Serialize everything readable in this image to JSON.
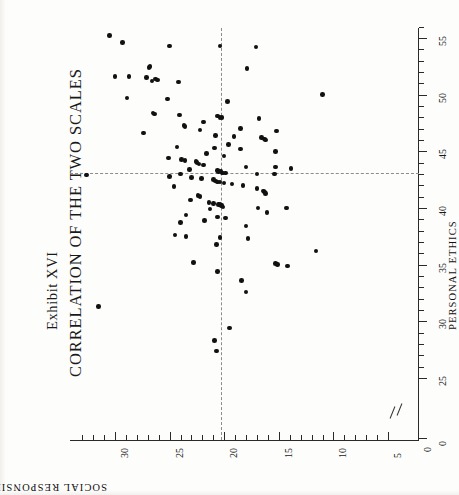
{
  "exhibit_label": "Exhibit XVI",
  "title": "CORRELATION OF THE TWO SCALES",
  "axes": {
    "horizontal_axis_title": "SOCIAL RESPONSIBILITY",
    "vertical_axis_title": "PERSONAL ETHICS"
  },
  "chart_data": {
    "type": "scatter",
    "title": "CORRELATION OF THE TWO SCALES",
    "subtitle": "Exhibit XVI",
    "orientation": "page rotated 90 degrees counter-clockwise",
    "xlabel": "PERSONAL ETHICS",
    "ylabel": "SOCIAL RESPONSIBILITY",
    "xlim": [
      25,
      56
    ],
    "ylim": [
      5,
      33
    ],
    "x_ticks": [
      0,
      25,
      30,
      35,
      40,
      45,
      50,
      55
    ],
    "x_tick_labels": [
      "0",
      "25",
      "30",
      "35",
      "40",
      "45",
      "50",
      "55"
    ],
    "x_minor_tick_step": 1,
    "y_ticks": [
      5,
      10,
      15,
      20,
      25,
      30
    ],
    "y_tick_labels": [
      "5",
      "10",
      "15",
      "20",
      "25",
      "30"
    ],
    "y_minor_tick_step": 1,
    "y_axis_origin_label": "0",
    "grid": false,
    "legend": null,
    "axis_break_horizontal": true,
    "axis_break_vertical": true,
    "reference_lines": [
      {
        "name": "mean-personal-ethics",
        "axis": "PERSONAL ETHICS",
        "value": 43.1,
        "style": "dashed"
      },
      {
        "name": "mean-social-responsibility",
        "axis": "SOCIAL RESPONSIBILITY",
        "value": 20.3,
        "style": "dashed"
      }
    ],
    "point_count": 118,
    "points": [
      [
        55.2,
        30.5
      ],
      [
        54.6,
        29.3
      ],
      [
        54.3,
        25.0
      ],
      [
        54.3,
        20.4
      ],
      [
        54.2,
        17.1
      ],
      [
        52.5,
        26.8
      ],
      [
        52.4,
        26.9
      ],
      [
        52.3,
        17.9
      ],
      [
        51.6,
        30.0
      ],
      [
        51.6,
        28.7
      ],
      [
        51.5,
        27.1
      ],
      [
        51.4,
        26.3
      ],
      [
        51.3,
        26.1
      ],
      [
        51.2,
        26.6
      ],
      [
        51.1,
        24.2
      ],
      [
        50.0,
        11.0
      ],
      [
        49.7,
        28.9
      ],
      [
        49.6,
        25.2
      ],
      [
        48.4,
        26.5
      ],
      [
        48.3,
        26.4
      ],
      [
        48.2,
        24.1
      ],
      [
        48.1,
        20.6
      ],
      [
        48.0,
        20.4
      ],
      [
        48.0,
        20.2
      ],
      [
        47.9,
        16.8
      ],
      [
        47.3,
        23.7
      ],
      [
        47.2,
        23.6
      ],
      [
        47.0,
        18.5
      ],
      [
        46.8,
        15.2
      ],
      [
        46.6,
        27.4
      ],
      [
        46.4,
        20.8
      ],
      [
        46.3,
        19.1
      ],
      [
        46.2,
        16.6
      ],
      [
        46.1,
        16.3
      ],
      [
        46.0,
        16.2
      ],
      [
        45.4,
        24.3
      ],
      [
        45.3,
        20.9
      ],
      [
        45.2,
        18.5
      ],
      [
        45.0,
        15.3
      ],
      [
        44.4,
        25.1
      ],
      [
        44.3,
        23.9
      ],
      [
        44.2,
        23.6
      ],
      [
        44.1,
        22.6
      ],
      [
        44.0,
        22.5
      ],
      [
        43.9,
        22.3
      ],
      [
        43.8,
        21.9
      ],
      [
        43.6,
        18.0
      ],
      [
        43.6,
        15.3
      ],
      [
        43.4,
        23.2
      ],
      [
        43.3,
        20.6
      ],
      [
        43.2,
        20.5
      ],
      [
        43.2,
        20.3
      ],
      [
        43.1,
        20.2
      ],
      [
        43.1,
        20.1
      ],
      [
        43.1,
        19.9
      ],
      [
        43.0,
        24.0
      ],
      [
        43.0,
        17.0
      ],
      [
        43.0,
        15.4
      ],
      [
        42.9,
        32.6
      ],
      [
        42.8,
        25.0
      ],
      [
        42.6,
        22.1
      ],
      [
        42.5,
        21.0
      ],
      [
        42.4,
        20.8
      ],
      [
        42.3,
        20.6
      ],
      [
        42.3,
        20.4
      ],
      [
        42.2,
        20.0
      ],
      [
        42.1,
        19.3
      ],
      [
        42.0,
        18.3
      ],
      [
        41.9,
        24.6
      ],
      [
        41.7,
        17.0
      ],
      [
        41.5,
        16.4
      ],
      [
        41.4,
        16.3
      ],
      [
        41.3,
        16.2
      ],
      [
        40.7,
        23.1
      ],
      [
        40.5,
        21.4
      ],
      [
        40.4,
        21.0
      ],
      [
        40.3,
        20.5
      ],
      [
        40.3,
        20.4
      ],
      [
        40.2,
        20.3
      ],
      [
        40.2,
        20.2
      ],
      [
        40.1,
        20.1
      ],
      [
        40.0,
        16.9
      ],
      [
        40.0,
        14.3
      ],
      [
        39.4,
        23.5
      ],
      [
        39.2,
        20.6
      ],
      [
        39.1,
        19.9
      ],
      [
        38.7,
        24.0
      ],
      [
        38.4,
        18.0
      ],
      [
        37.6,
        24.5
      ],
      [
        37.5,
        23.5
      ],
      [
        37.4,
        20.4
      ],
      [
        37.3,
        17.8
      ],
      [
        36.2,
        11.6
      ],
      [
        35.2,
        22.8
      ],
      [
        35.1,
        15.3
      ],
      [
        35.0,
        15.1
      ],
      [
        34.9,
        14.2
      ],
      [
        34.4,
        20.6
      ],
      [
        33.6,
        18.4
      ],
      [
        32.6,
        18.0
      ],
      [
        29.4,
        19.5
      ],
      [
        31.3,
        31.5
      ],
      [
        28.3,
        20.9
      ],
      [
        27.4,
        20.7
      ],
      [
        49.4,
        19.7
      ],
      [
        47.6,
        21.9
      ],
      [
        46.9,
        22.2
      ],
      [
        45.6,
        19.6
      ],
      [
        44.8,
        21.6
      ],
      [
        44.6,
        20.0
      ],
      [
        43.5,
        13.9
      ],
      [
        42.7,
        23.0
      ],
      [
        41.1,
        22.4
      ],
      [
        41.0,
        22.2
      ],
      [
        39.9,
        21.3
      ],
      [
        39.6,
        16.1
      ],
      [
        38.9,
        21.8
      ],
      [
        36.8,
        20.7
      ]
    ]
  }
}
